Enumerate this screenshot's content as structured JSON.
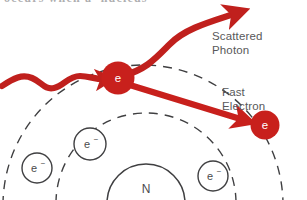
{
  "figure": {
    "clipped_heading_text": "occurs when a  nucleus",
    "background_color": "#ffffff"
  },
  "colors": {
    "photon_red": "#c0201d",
    "electron_red": "#c8201c",
    "label_gray": "#58585a",
    "line_gray": "#4a4a4c",
    "white": "#ffffff"
  },
  "labels": {
    "scattered_photon": "Scattered\nPhoton",
    "fast_electron": "Fast\nElectron"
  },
  "particles": {
    "struck_electron": {
      "symbol": "e",
      "charge": "",
      "x": 118,
      "y": 78,
      "r": 16
    },
    "fast_electron": {
      "symbol": "e",
      "charge": "",
      "x": 265,
      "y": 125,
      "r": 14
    },
    "orbital_electrons": [
      {
        "symbol": "e",
        "charge": "-",
        "x": 37,
        "y": 168,
        "r": 15
      },
      {
        "symbol": "e",
        "charge": "-",
        "x": 90,
        "y": 144,
        "r": 16
      },
      {
        "symbol": "e",
        "charge": "-",
        "x": 213,
        "y": 176,
        "r": 15
      }
    ],
    "nucleus": {
      "symbol": "N",
      "x": 146,
      "y": 193
    }
  },
  "rays": {
    "incident_photon": "wavy-red-arrow-from-left",
    "scattered_photon": "curved-red-arrow-up-right",
    "fast_electron_track": "straight-red-arrow-down-right"
  },
  "orbits": {
    "inner_shell": "solid-semicircle",
    "middle_shell": "dashed-semicircle",
    "outer_shell": "dashed-semicircle"
  }
}
